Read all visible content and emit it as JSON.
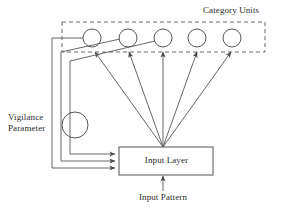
{
  "diagram": {
    "stroke_color": "#555555",
    "text_color": "#2b2b2b",
    "background": "#ffffff",
    "labels": {
      "category_units": "Category Units",
      "vigilance_line1": "Vigilance",
      "vigilance_line2": "Parameter",
      "input_layer": "Input Layer",
      "input_pattern": "Input Pattern"
    },
    "category_layer": {
      "dashed_box": {
        "x": 62,
        "y": 22,
        "width": 203,
        "height": 30
      },
      "unit_count": 5,
      "unit_radius": 9,
      "units": [
        {
          "name": "category-unit-1",
          "cx": 92,
          "cy": 38
        },
        {
          "name": "category-unit-2",
          "cx": 128,
          "cy": 38
        },
        {
          "name": "category-unit-3",
          "cx": 163,
          "cy": 38
        },
        {
          "name": "category-unit-4",
          "cx": 197,
          "cy": 38
        },
        {
          "name": "category-unit-5",
          "cx": 232,
          "cy": 38
        }
      ]
    },
    "vigilance_node": {
      "cx": 75,
      "cy": 125,
      "r": 13
    },
    "input_layer_box": {
      "x": 119,
      "y": 147,
      "width": 94,
      "height": 28
    },
    "fan_origin": {
      "x": 163,
      "y": 147
    },
    "feedback_lines": 3,
    "input_pattern_arrow": {
      "x": 163,
      "y_from": 192,
      "y_to": 175
    }
  }
}
